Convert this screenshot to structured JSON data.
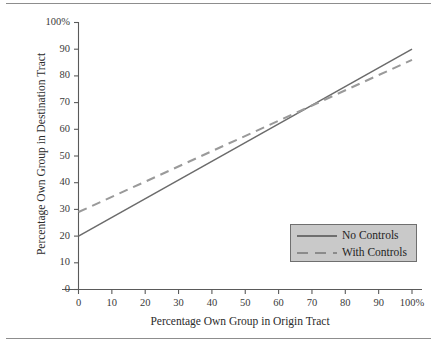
{
  "chart_data": {
    "type": "line",
    "title": "",
    "xlabel": "Percentage Own Group in Origin Tract",
    "ylabel": "Percentage Own Group in Destination Tract",
    "xlim": [
      0,
      100
    ],
    "ylim": [
      0,
      100
    ],
    "grid": false,
    "legend_position": "lower-right",
    "xticks": [
      0,
      10,
      20,
      30,
      40,
      50,
      60,
      70,
      80,
      90,
      100
    ],
    "xtick_labels": [
      "0",
      "10",
      "20",
      "30",
      "40",
      "50",
      "60",
      "70",
      "80",
      "90",
      "100%"
    ],
    "yticks": [
      0,
      10,
      20,
      30,
      40,
      50,
      60,
      70,
      80,
      90,
      100
    ],
    "ytick_labels": [
      "0",
      "10",
      "20",
      "30",
      "40",
      "50",
      "60",
      "70",
      "80",
      "90",
      "100%"
    ],
    "x": [
      0,
      100
    ],
    "series": [
      {
        "name": "No Controls",
        "style": "solid",
        "color": "#6b6b6b",
        "values": [
          20,
          90
        ],
        "intercept": 20,
        "slope": 0.7
      },
      {
        "name": "With Controls",
        "style": "dashed",
        "color": "#9a9a9a",
        "values": [
          29,
          86
        ],
        "intercept": 29,
        "slope": 0.57
      }
    ],
    "crossing_point": {
      "x": 68,
      "y": 67.5
    }
  },
  "legend": {
    "entries": [
      {
        "label": "No Controls"
      },
      {
        "label": "With Controls"
      }
    ]
  },
  "axes": {
    "x_title": "Percentage Own Group in Origin Tract",
    "y_title": "Percentage Own Group in Destination Tract"
  },
  "colors": {
    "no_controls_line": "#6b6b6b",
    "with_controls_line": "#9a9a9a",
    "axis": "#5a5a5a",
    "legend_background": "#c9c9c9",
    "legend_border": "#6f6f6f",
    "rule": "#8d8d8d",
    "text": "#2b2b2b"
  }
}
